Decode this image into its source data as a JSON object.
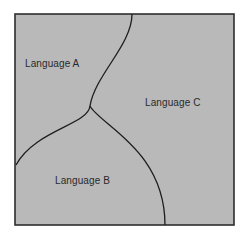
{
  "diagram": {
    "type": "region-map",
    "panel": {
      "x": 15,
      "y": 14,
      "width": 219,
      "height": 211,
      "fill": "#b9b9b9",
      "border": "#2e2e2e"
    },
    "boundary_color": "#1e1e1e",
    "regions": [
      {
        "id": "A",
        "label": "Language A",
        "x": 25,
        "y": 58
      },
      {
        "id": "B",
        "label": "Language B",
        "x": 55,
        "y": 175
      },
      {
        "id": "C",
        "label": "Language C",
        "x": 145,
        "y": 97
      }
    ],
    "boundaries": [
      {
        "name": "A-C boundary",
        "path": "M132,14 C132,45 95,75 90,106"
      },
      {
        "name": "A-B boundary",
        "path": "M90,106 C88,125 35,130 16,165"
      },
      {
        "name": "B-C boundary",
        "path": "M90,106 C100,125 165,150 165,225"
      }
    ]
  }
}
